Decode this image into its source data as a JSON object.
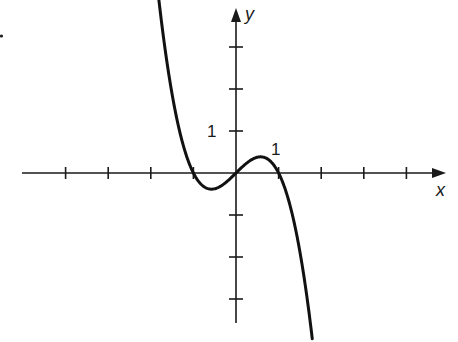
{
  "chart_data": {
    "type": "line",
    "title": "",
    "xlabel": "x",
    "ylabel": "y",
    "function": "y = -x^3 + x",
    "xlim": [
      -4.2,
      4.6
    ],
    "ylim": [
      -3.5,
      4.0
    ],
    "x_ticks": [
      -4,
      -3,
      -2,
      -1,
      0,
      1,
      2,
      3,
      4
    ],
    "y_ticks": [
      -3,
      -2,
      -1,
      0,
      1,
      2,
      3
    ],
    "tick_labels": {
      "x": [
        "1"
      ],
      "y": [
        "1"
      ]
    },
    "grid": false,
    "x_intercepts": [
      -1,
      0,
      1
    ],
    "local_max": [
      0.58,
      0.38
    ],
    "local_min": [
      -0.58,
      -0.38
    ],
    "series": [
      {
        "name": "curve",
        "x": [
          -1.8,
          -1.5,
          -1.2,
          -1.0,
          -0.8,
          -0.58,
          -0.3,
          0,
          0.3,
          0.58,
          0.8,
          1.0,
          1.2,
          1.5,
          1.8
        ],
        "y": [
          4.03,
          1.88,
          0.53,
          0.0,
          -0.29,
          -0.38,
          -0.27,
          0,
          0.27,
          0.38,
          0.29,
          0.0,
          -0.53,
          -1.88,
          -4.03
        ]
      }
    ]
  },
  "labels": {
    "x_axis": "x",
    "y_axis": "y",
    "x_one": "1",
    "y_one": "1"
  }
}
